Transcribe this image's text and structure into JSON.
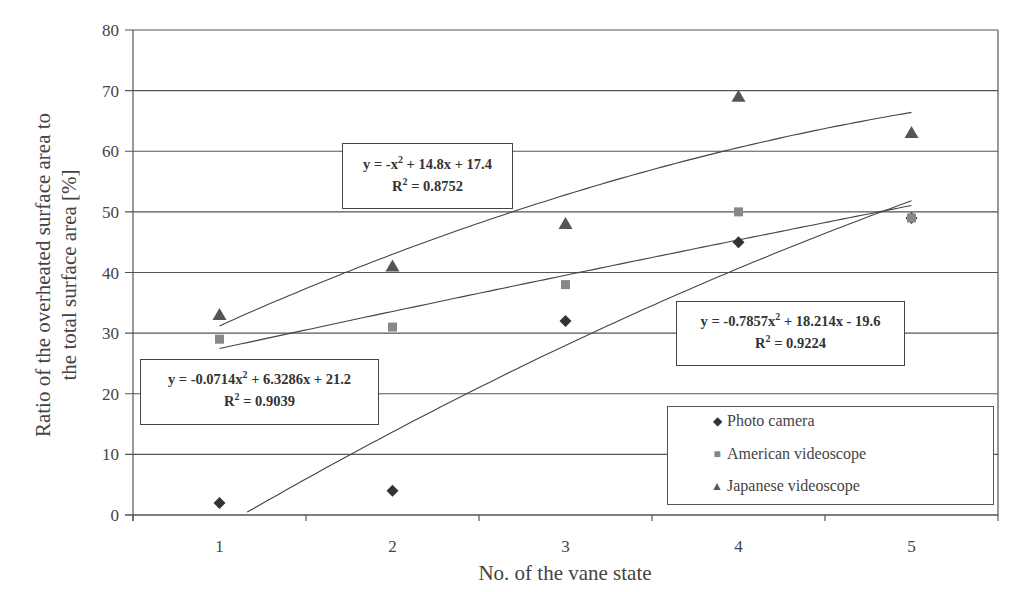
{
  "chart_data": {
    "type": "scatter",
    "title": "",
    "xlabel": "No. of the vane state",
    "ylabel": "Ratio of the overheated surface area to the total surface area [%]",
    "ylabel_lines": [
      "Ratio of the overheated surface area to",
      "the total surface area [%]"
    ],
    "categories": [
      "1",
      "2",
      "3",
      "4",
      "5"
    ],
    "x": [
      1,
      2,
      3,
      4,
      5
    ],
    "ylim": [
      0,
      80
    ],
    "yticks": [
      0,
      10,
      20,
      30,
      40,
      50,
      60,
      70,
      80
    ],
    "grid": "horizontal",
    "legend_position": "lower right",
    "series": [
      {
        "name": "Photo camera",
        "marker": "diamond",
        "color": "#333333",
        "values": [
          2,
          4,
          32,
          45,
          49
        ],
        "trendline": {
          "type": "polynomial-2",
          "a": -0.7857,
          "b": 18.214,
          "c": -19.6,
          "equation": "y = -0.7857x² + 18.214x - 19.6",
          "r2": "R² = 0.9224"
        }
      },
      {
        "name": "American videoscope",
        "marker": "square",
        "color": "#888888",
        "values": [
          29,
          31,
          38,
          50,
          49
        ],
        "trendline": {
          "type": "polynomial-2",
          "a": -0.0714,
          "b": 6.3286,
          "c": 21.2,
          "equation": "y = -0.0714x² + 6.3286x + 21.2",
          "r2": "R² = 0.9039"
        }
      },
      {
        "name": "Japanese videoscope",
        "marker": "triangle",
        "color": "#555555",
        "values": [
          33,
          41,
          48,
          69,
          63
        ],
        "trendline": {
          "type": "polynomial-2",
          "a": -1,
          "b": 14.8,
          "c": 17.4,
          "equation": "y = -x² + 14.8x + 17.4",
          "r2": "R² = 0.8752"
        }
      }
    ]
  },
  "equation_boxes": {
    "japanese": {
      "eq_pre": "y = -x",
      "eq_post": "+ 14.8x + 17.4",
      "r_pre": "R",
      "r_post": "= 0.8752"
    },
    "american": {
      "eq_pre": "y = -0.0714x",
      "eq_post": "+ 6.3286x + 21.2",
      "r_pre": "R",
      "r_post": "= 0.9039"
    },
    "photo": {
      "eq_pre": "y = -0.7857x",
      "eq_post": "+ 18.214x - 19.6",
      "r_pre": "R",
      "r_post": "= 0.9224"
    },
    "sup": "2"
  },
  "legend": {
    "items": [
      {
        "label": "Photo camera",
        "glyph": "◆"
      },
      {
        "label": "American videoscope",
        "glyph": "■"
      },
      {
        "label": "Japanese videoscope",
        "glyph": "▲"
      }
    ]
  }
}
